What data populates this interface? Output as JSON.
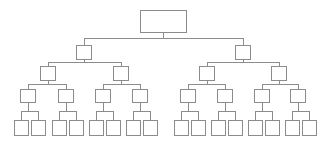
{
  "diagram": {
    "type": "binary-tree",
    "depth": 5,
    "leaf_count": 16,
    "node_count": 31,
    "background_color": "#ffffff",
    "stroke_color": "#8c8c8c",
    "node_fill_color": "#ffffff",
    "stroke_width": 1,
    "canvas": {
      "width": 323,
      "height": 144
    },
    "levels": [
      {
        "index": 0,
        "name": "root-level",
        "node_shape": "rectangle",
        "node_width": 46,
        "node_height": 22,
        "center_y": 21,
        "nodes": [
          {
            "id": "n0",
            "label": "",
            "cx": 163.5
          }
        ]
      },
      {
        "index": 1,
        "name": "level-1",
        "node_shape": "square",
        "node_width": 15,
        "node_height": 14,
        "center_y": 52,
        "nodes": [
          {
            "id": "n1",
            "label": "",
            "cx": 84
          },
          {
            "id": "n2",
            "label": "",
            "cx": 243
          }
        ]
      },
      {
        "index": 2,
        "name": "level-2",
        "node_shape": "square",
        "node_width": 15,
        "node_height": 14,
        "center_y": 73,
        "nodes": [
          {
            "id": "n3",
            "label": "",
            "cx": 48
          },
          {
            "id": "n4",
            "label": "",
            "cx": 121
          },
          {
            "id": "n5",
            "label": "",
            "cx": 207
          },
          {
            "id": "n6",
            "label": "",
            "cx": 279
          }
        ]
      },
      {
        "index": 3,
        "name": "level-3",
        "node_shape": "square",
        "node_width": 15,
        "node_height": 13,
        "center_y": 96,
        "nodes": [
          {
            "id": "n7",
            "label": "",
            "cx": 28
          },
          {
            "id": "n8",
            "label": "",
            "cx": 66
          },
          {
            "id": "n9",
            "label": "",
            "cx": 103
          },
          {
            "id": "n10",
            "label": "",
            "cx": 140
          },
          {
            "id": "n11",
            "label": "",
            "cx": 188
          },
          {
            "id": "n12",
            "label": "",
            "cx": 225
          },
          {
            "id": "n13",
            "label": "",
            "cx": 262
          },
          {
            "id": "n14",
            "label": "",
            "cx": 298
          }
        ]
      },
      {
        "index": 4,
        "name": "leaf-level",
        "node_shape": "square",
        "node_width": 14,
        "node_height": 15,
        "center_y": 128,
        "nodes": [
          {
            "id": "n15",
            "label": "",
            "cx": 21
          },
          {
            "id": "n16",
            "label": "",
            "cx": 38
          },
          {
            "id": "n17",
            "label": "",
            "cx": 59
          },
          {
            "id": "n18",
            "label": "",
            "cx": 76
          },
          {
            "id": "n19",
            "label": "",
            "cx": 96
          },
          {
            "id": "n20",
            "label": "",
            "cx": 113
          },
          {
            "id": "n21",
            "label": "",
            "cx": 133
          },
          {
            "id": "n22",
            "label": "",
            "cx": 150
          },
          {
            "id": "n23",
            "label": "",
            "cx": 181
          },
          {
            "id": "n24",
            "label": "",
            "cx": 198
          },
          {
            "id": "n25",
            "label": "",
            "cx": 218
          },
          {
            "id": "n26",
            "label": "",
            "cx": 235
          },
          {
            "id": "n27",
            "label": "",
            "cx": 255
          },
          {
            "id": "n28",
            "label": "",
            "cx": 272
          },
          {
            "id": "n29",
            "label": "",
            "cx": 292
          },
          {
            "id": "n30",
            "label": "",
            "cx": 309
          }
        ]
      }
    ],
    "edges": [
      {
        "from": "n0",
        "to": "n1"
      },
      {
        "from": "n0",
        "to": "n2"
      },
      {
        "from": "n1",
        "to": "n3"
      },
      {
        "from": "n1",
        "to": "n4"
      },
      {
        "from": "n2",
        "to": "n5"
      },
      {
        "from": "n2",
        "to": "n6"
      },
      {
        "from": "n3",
        "to": "n7"
      },
      {
        "from": "n3",
        "to": "n8"
      },
      {
        "from": "n4",
        "to": "n9"
      },
      {
        "from": "n4",
        "to": "n10"
      },
      {
        "from": "n5",
        "to": "n11"
      },
      {
        "from": "n5",
        "to": "n12"
      },
      {
        "from": "n6",
        "to": "n13"
      },
      {
        "from": "n6",
        "to": "n14"
      },
      {
        "from": "n7",
        "to": "n15"
      },
      {
        "from": "n7",
        "to": "n16"
      },
      {
        "from": "n8",
        "to": "n17"
      },
      {
        "from": "n8",
        "to": "n18"
      },
      {
        "from": "n9",
        "to": "n19"
      },
      {
        "from": "n9",
        "to": "n20"
      },
      {
        "from": "n10",
        "to": "n21"
      },
      {
        "from": "n10",
        "to": "n22"
      },
      {
        "from": "n11",
        "to": "n23"
      },
      {
        "from": "n11",
        "to": "n24"
      },
      {
        "from": "n12",
        "to": "n25"
      },
      {
        "from": "n12",
        "to": "n26"
      },
      {
        "from": "n13",
        "to": "n27"
      },
      {
        "from": "n13",
        "to": "n28"
      },
      {
        "from": "n14",
        "to": "n29"
      },
      {
        "from": "n14",
        "to": "n30"
      }
    ]
  }
}
